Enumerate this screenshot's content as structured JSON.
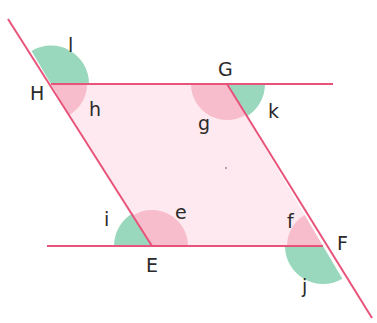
{
  "diagram": {
    "type": "parallelogram-angles",
    "colors": {
      "line": "#e8537a",
      "fill": "#fde9ef",
      "interior_angle": "#f6b8c8",
      "exterior_angle": "#93d6b8",
      "text": "#2a2a2a"
    },
    "vertices": {
      "H": {
        "label": "H",
        "x": 51,
        "y": 84
      },
      "G": {
        "label": "G",
        "x": 227,
        "y": 84
      },
      "F": {
        "label": "F",
        "x": 323,
        "y": 246
      },
      "E": {
        "label": "E",
        "x": 152,
        "y": 246
      }
    },
    "angles": {
      "h": {
        "label": "h",
        "at": "H",
        "kind": "interior"
      },
      "l": {
        "label": "l",
        "at": "H",
        "kind": "exterior"
      },
      "g": {
        "label": "g",
        "at": "G",
        "kind": "interior"
      },
      "k": {
        "label": "k",
        "at": "G",
        "kind": "exterior"
      },
      "e": {
        "label": "e",
        "at": "E",
        "kind": "interior"
      },
      "i": {
        "label": "i",
        "at": "E",
        "kind": "exterior"
      },
      "f": {
        "label": "f",
        "at": "F",
        "kind": "interior"
      },
      "j": {
        "label": "j",
        "at": "F",
        "kind": "exterior"
      }
    }
  }
}
